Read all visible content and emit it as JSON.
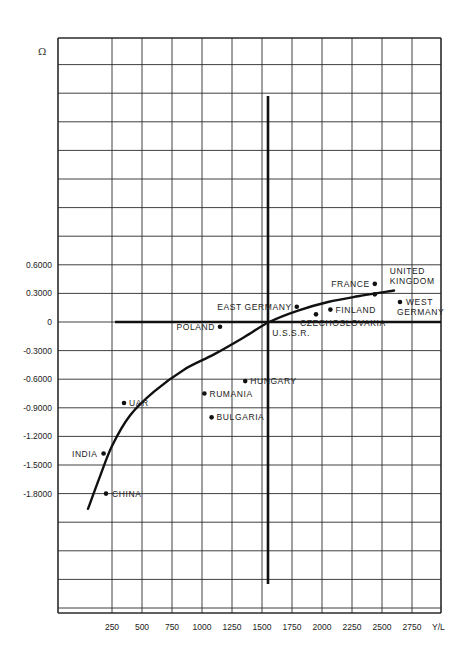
{
  "chart_data": {
    "type": "scatter",
    "title": "",
    "xlabel": "Y/L",
    "ylabel": "Ω",
    "x_ticks": [
      250,
      500,
      750,
      1000,
      1250,
      1500,
      1750,
      2000,
      2250,
      2500,
      2750
    ],
    "y_ticks": [
      0.6,
      0.3,
      0,
      -0.3,
      -0.6,
      -0.9,
      -1.2,
      -1.5,
      -1.8
    ],
    "y_tick_labels": [
      "0.6000",
      "0.3000",
      "0",
      "-0.3000",
      "-0.6000",
      "-0.9000",
      "-1.2000",
      "-1.5000",
      "-1.8000"
    ],
    "xlim": [
      -200,
      2950
    ],
    "ylim": [
      -3.0,
      3.0
    ],
    "grid": true,
    "reference_lines": {
      "vertical_x": 1550,
      "horizontal_y": 0
    },
    "points": [
      {
        "name": "CHINA",
        "x": 200,
        "y": -1.8
      },
      {
        "name": "INDIA",
        "x": 180,
        "y": -1.38
      },
      {
        "name": "UAR",
        "x": 350,
        "y": -0.85
      },
      {
        "name": "RUMANIA",
        "x": 1020,
        "y": -0.75
      },
      {
        "name": "BULGARIA",
        "x": 1080,
        "y": -1.0
      },
      {
        "name": "HUNGARY",
        "x": 1360,
        "y": -0.62
      },
      {
        "name": "POLAND",
        "x": 1150,
        "y": -0.05
      },
      {
        "name": "U.S.S.R.",
        "x": 1560,
        "y": 0.0
      },
      {
        "name": "EAST GERMANY",
        "x": 1790,
        "y": 0.16
      },
      {
        "name": "CZECHOSLOVAKIA",
        "x": 1950,
        "y": 0.08
      },
      {
        "name": "FINLAND",
        "x": 2070,
        "y": 0.13
      },
      {
        "name": "FRANCE",
        "x": 2440,
        "y": 0.4
      },
      {
        "name": "UNITED KINGDOM",
        "x": 2440,
        "y": 0.29
      },
      {
        "name": "WEST GERMANY",
        "x": 2650,
        "y": 0.21
      }
    ],
    "fit_curve": {
      "description": "Hand-fitted increasing concave curve",
      "points": [
        [
          50,
          -1.96
        ],
        [
          150,
          -1.62
        ],
        [
          250,
          -1.3
        ],
        [
          400,
          -0.98
        ],
        [
          600,
          -0.73
        ],
        [
          850,
          -0.5
        ],
        [
          1100,
          -0.34
        ],
        [
          1350,
          -0.16
        ],
        [
          1560,
          0.0
        ],
        [
          1800,
          0.12
        ],
        [
          2050,
          0.21
        ],
        [
          2300,
          0.27
        ],
        [
          2600,
          0.33
        ]
      ]
    }
  },
  "labels": {
    "omega": "Ω",
    "x_axis": "Y/L"
  }
}
